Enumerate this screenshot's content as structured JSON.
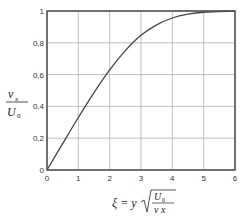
{
  "chart_data": {
    "type": "line",
    "title": "",
    "xlabel": "ξ = y √(U₀ / (ν x))",
    "ylabel": "vₓ / U₀",
    "xlim": [
      0,
      6
    ],
    "ylim": [
      0,
      1
    ],
    "grid": true,
    "legend": null,
    "x_ticks": [
      "0",
      "1",
      "2",
      "3",
      "4",
      "5",
      "6"
    ],
    "y_ticks": [
      "0",
      "0,2",
      "0,4",
      "0,6",
      "0,8",
      "1"
    ],
    "series": [
      {
        "name": "velocity profile",
        "x": [
          0,
          0.5,
          1.0,
          1.5,
          2.0,
          2.5,
          3.0,
          3.5,
          4.0,
          4.5,
          5.0,
          6.0
        ],
        "y": [
          0,
          0.166,
          0.33,
          0.487,
          0.63,
          0.751,
          0.847,
          0.913,
          0.956,
          0.98,
          0.992,
          1.0
        ]
      }
    ]
  },
  "labels": {
    "y_num": "v",
    "y_num_sub": "x",
    "y_den": "U",
    "y_den_sub": "0",
    "x_xi": "ξ = y",
    "x_num": "U",
    "x_num_sub": "0",
    "x_den": "ν x"
  },
  "colors": {
    "axis": "#555555",
    "grid": "#b0b0b0",
    "curve": "#444444"
  }
}
